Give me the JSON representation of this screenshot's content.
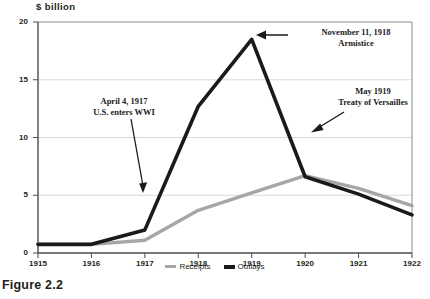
{
  "figure": {
    "caption": "Figure 2.2"
  },
  "chart_data": {
    "type": "line",
    "title": "$ billion",
    "xlabel": "",
    "ylabel": "$ billion",
    "x": [
      1915,
      1916,
      1917,
      1918,
      1919,
      1920,
      1921,
      1922
    ],
    "xtick_labels": [
      "1915",
      "1916",
      "1917",
      "1918",
      "1919",
      "1920",
      "1921",
      "1922"
    ],
    "ytick_labels": [
      "0",
      "5",
      "10",
      "15",
      "20"
    ],
    "yticks": [
      0,
      5,
      10,
      15,
      20
    ],
    "ylim": [
      0,
      20
    ],
    "xlim": [
      1915,
      1922
    ],
    "grid": true,
    "legend_position": "bottom-center",
    "series": [
      {
        "name": "Receipts",
        "color": "#a6a6a6",
        "values": [
          0.75,
          0.75,
          1.1,
          3.7,
          5.2,
          6.7,
          5.6,
          4.1
        ]
      },
      {
        "name": "Outlays",
        "color": "#1a1a1a",
        "values": [
          0.75,
          0.75,
          2.0,
          12.7,
          18.5,
          6.6,
          5.1,
          3.3
        ]
      }
    ],
    "annotations": [
      {
        "id": "wwi",
        "line1": "April 4, 1917",
        "line2": "U.S. enters WWI",
        "points_to_year": 1917
      },
      {
        "id": "armistice",
        "line1": "November 11, 1918",
        "line2": "Armistice",
        "points_to_year": 1919
      },
      {
        "id": "versailles",
        "line1": "May 1919",
        "line2": "Treaty of Versailles",
        "points_to_year": 1920
      }
    ]
  }
}
